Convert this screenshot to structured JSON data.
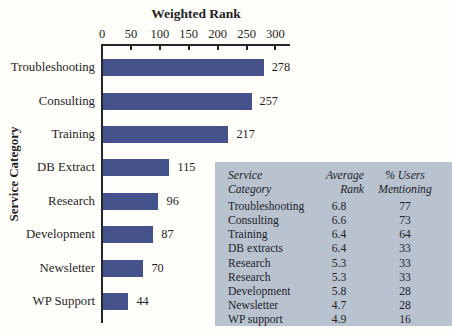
{
  "chart_data": {
    "type": "bar",
    "orientation": "horizontal",
    "title": "Weighted Rank",
    "ylabel": "Service Category",
    "xlim": [
      0,
      310
    ],
    "x_ticks": [
      0,
      50,
      100,
      150,
      200,
      250,
      300
    ],
    "grid": false,
    "categories": [
      "Troubleshooting",
      "Consulting",
      "Training",
      "DB Extract",
      "Research",
      "Development",
      "Newsletter",
      "WP Support"
    ],
    "values": [
      278,
      257,
      217,
      115,
      96,
      87,
      70,
      44
    ],
    "bar_color": "#46528c",
    "axis_color": "#25252c"
  },
  "table": {
    "background_color": "#b9c2cf",
    "headers": [
      {
        "lines": [
          "Service",
          "Category"
        ]
      },
      {
        "lines": [
          "Average",
          "Rank"
        ]
      },
      {
        "lines": [
          "% Users",
          "Mentioning"
        ]
      }
    ],
    "rows": [
      {
        "category": "Troubleshooting",
        "average_rank": "6.8",
        "pct_users": "77"
      },
      {
        "category": "Consulting",
        "average_rank": "6.6",
        "pct_users": "73"
      },
      {
        "category": "Training",
        "average_rank": "6.4",
        "pct_users": "64"
      },
      {
        "category": "DB extracts",
        "average_rank": "6.4",
        "pct_users": "33"
      },
      {
        "category": "Research",
        "average_rank": "5.3",
        "pct_users": "33"
      },
      {
        "category": "Research",
        "average_rank": "5.3",
        "pct_users": "33"
      },
      {
        "category": "Development",
        "average_rank": "5.8",
        "pct_users": "28"
      },
      {
        "category": "Newsletter",
        "average_rank": "4.7",
        "pct_users": "28"
      },
      {
        "category": "WP support",
        "average_rank": "4.9",
        "pct_users": "16"
      }
    ]
  }
}
